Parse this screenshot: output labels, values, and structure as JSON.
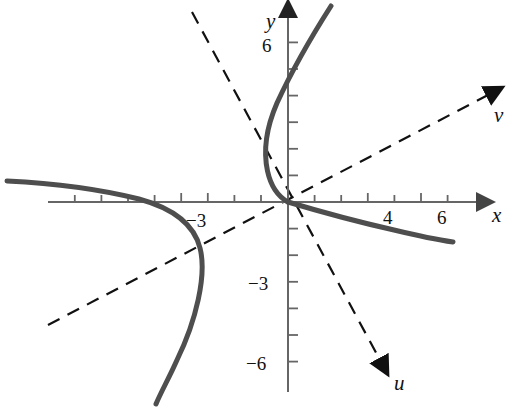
{
  "figure": {
    "background_color": "#ffffff",
    "width": 517,
    "height": 408
  },
  "axes": {
    "origin_px": [
      288,
      202
    ],
    "unit_px": 26.6,
    "x_axis": {
      "label": "x",
      "label_pos_px": [
        498,
        216
      ],
      "color": "#555555",
      "arrow": "right",
      "start_px": [
        48,
        202
      ],
      "end_px": [
        484,
        202
      ],
      "tick_labels": [
        {
          "text": "4",
          "value": 4,
          "pos_px": [
            390,
            222
          ]
        },
        {
          "text": "6",
          "value": 6,
          "pos_px": [
            444,
            222
          ]
        },
        {
          "text": "−3",
          "value": -3,
          "pos_px": [
            200,
            222
          ]
        }
      ],
      "ticks": [
        -8,
        -7,
        -6,
        -5,
        -4,
        -3,
        -2,
        -1,
        1,
        2,
        3,
        4,
        5,
        6,
        7
      ]
    },
    "y_axis": {
      "label": "y",
      "label_pos_px": [
        272,
        22
      ],
      "color": "#555555",
      "arrow": "up",
      "start_px": [
        288,
        392
      ],
      "end_px": [
        288,
        10
      ],
      "tick_labels": [
        {
          "text": "6",
          "value": 6,
          "pos_px": [
            268,
            52
          ]
        },
        {
          "text": "−3",
          "value": -3,
          "pos_px": [
            258,
            290
          ]
        },
        {
          "text": "−6",
          "value": -6,
          "pos_px": [
            258,
            370
          ]
        }
      ],
      "ticks": [
        -7,
        -6,
        -5,
        -4,
        -3,
        -2,
        -1,
        1,
        2,
        3,
        4,
        5,
        6
      ]
    },
    "u_axis": {
      "label": "u",
      "label_pos_px": [
        402,
        383
      ],
      "style": "dashed",
      "color": "#111111",
      "arrow": "down-right",
      "line_start_px": [
        192,
        12
      ],
      "line_end_px": [
        388,
        375
      ],
      "angle_deg": -61.6
    },
    "v_axis": {
      "label": "v",
      "label_pos_px": [
        500,
        116
      ],
      "style": "dashed",
      "color": "#111111",
      "arrow": "up-right",
      "line_start_px": [
        48,
        325
      ],
      "line_end_px": [
        494,
        92
      ],
      "angle_deg": 27.6
    }
  },
  "curve": {
    "name": "rotated-conic-curve",
    "color": "#4a4a4a",
    "stroke_width": 5,
    "style": "solid",
    "description": "Curve with two visible branches passing through the origin; left branch opens leftward with a vertical tangent near x=-3.3, y=-1.7; a branch rises steeply from the origin to upper right; a branch descends gently from the origin to lower right.",
    "branch_upper_path_px": "M 288 202 C 280 196 272 186 268 170 C 264 150 268 126 278 104 C 290 78 308 44 330 8",
    "branch_right_path_px": "M 288 202 C 316 210 352 220 392 229 C 418 235 438 239 452 241",
    "branch_left_path_px": "M 8 182 C 50 184 100 190 140 200 C 172 209 194 224 200 248 C 206 274 196 320 176 360 C 168 378 160 392 155 402"
  },
  "tick_style": {
    "major_len_px": 10,
    "minor_len_px": 7,
    "color": "#555555"
  }
}
